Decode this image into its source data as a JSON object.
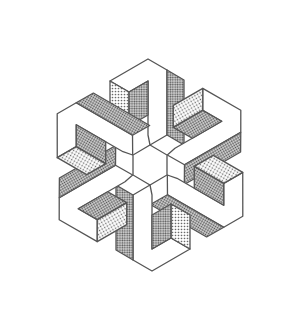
{
  "figure": {
    "description": "Isometric line drawing of a six-fold rotationally symmetric interlocking block structure with stippled shading",
    "colors": {
      "background": "#ffffff",
      "outline": "#555555",
      "light_face": "#ffffff",
      "medium_face": "#bdbdbd",
      "dark_face": "#8e8e8e"
    },
    "center": [
      150,
      165
    ]
  }
}
